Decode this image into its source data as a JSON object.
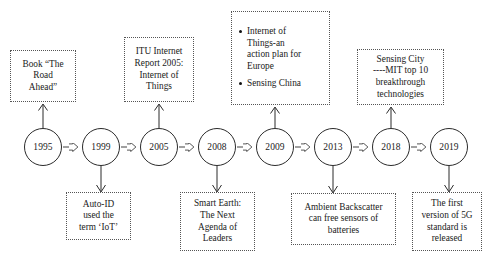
{
  "diagram": {
    "type": "timeline-flow",
    "colors": {
      "stroke": "#2b2b2b",
      "box_border": "#555555",
      "background": "#ffffff",
      "text": "#1a1a1a"
    },
    "nodes": [
      {
        "id": "n1995",
        "year": "1995"
      },
      {
        "id": "n1999",
        "year": "1999"
      },
      {
        "id": "n2005",
        "year": "2005"
      },
      {
        "id": "n2008",
        "year": "2008"
      },
      {
        "id": "n2009",
        "year": "2009"
      },
      {
        "id": "n2013",
        "year": "2013"
      },
      {
        "id": "n2018",
        "year": "2018"
      },
      {
        "id": "n2019",
        "year": "2019"
      }
    ],
    "callouts_top": [
      {
        "id": "c-book",
        "year": "1995",
        "lines": [
          "Book “The",
          "Road",
          "Ahead”"
        ]
      },
      {
        "id": "c-itu",
        "year": "2005",
        "lines": [
          "ITU Internet",
          "Report 2005:",
          "Internet of",
          "Things"
        ]
      },
      {
        "id": "c-eu-china",
        "year": "2009",
        "bullets": [
          [
            "Internet of",
            "Things-an",
            "action plan for",
            "Europe"
          ],
          [
            "Sensing China"
          ]
        ]
      },
      {
        "id": "c-sensing-city",
        "year": "2018",
        "lines": [
          "Sensing City",
          "----MIT top 10",
          "breakthrough",
          "technologies"
        ]
      }
    ],
    "callouts_bottom": [
      {
        "id": "c-autoid",
        "year": "1999",
        "lines": [
          "Auto-ID",
          "used the",
          "term ‘IoT’"
        ]
      },
      {
        "id": "c-smart-earth",
        "year": "2008",
        "lines": [
          "Smart Earth:",
          "The Next",
          "Agenda of",
          "Leaders"
        ]
      },
      {
        "id": "c-ambient",
        "year": "2013",
        "lines": [
          "Ambient Backscatter",
          "can free sensors of",
          "batteries"
        ]
      },
      {
        "id": "c-5g",
        "year": "2019",
        "lines": [
          "The first",
          "version of 5G",
          "standard  is",
          "released"
        ]
      }
    ]
  }
}
